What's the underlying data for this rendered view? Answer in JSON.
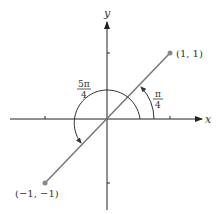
{
  "axes": {
    "x_label": "x",
    "y_label": "y"
  },
  "points": [
    {
      "label": "(1, 1)",
      "x": 1,
      "y": 1
    },
    {
      "label": "(−1, −1)",
      "x": -1,
      "y": -1
    }
  ],
  "angles": {
    "small": {
      "numerator": "π",
      "denominator": "4"
    },
    "large": {
      "numerator": "5π",
      "denominator": "4"
    }
  },
  "colors": {
    "axis": "#222222",
    "line": "#777777",
    "point": "#888888"
  }
}
